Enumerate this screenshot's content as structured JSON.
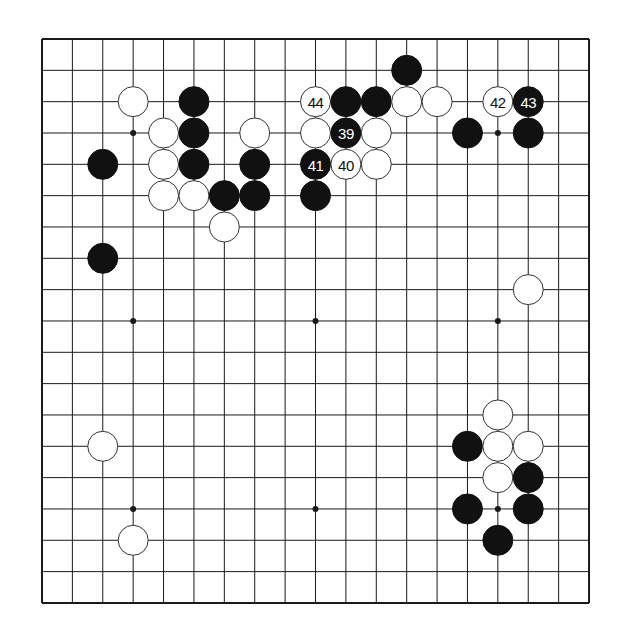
{
  "board": {
    "size": 19,
    "origin": {
      "x": 42,
      "y": 39
    },
    "spacing": {
      "x": 30.39,
      "y": 31.33
    },
    "stone_radius": 15,
    "colors": {
      "line": "#1a1a1a",
      "black": "#111111",
      "white": "#ffffff",
      "background": "#ffffff"
    },
    "star_points": [
      [
        3,
        3
      ],
      [
        9,
        3
      ],
      [
        15,
        3
      ],
      [
        3,
        9
      ],
      [
        9,
        9
      ],
      [
        15,
        9
      ],
      [
        3,
        15
      ],
      [
        9,
        15
      ],
      [
        15,
        15
      ]
    ]
  },
  "stones": [
    {
      "col": 12,
      "row": 1,
      "color": "black",
      "label": ""
    },
    {
      "col": 9,
      "row": 2,
      "color": "white",
      "label": "44"
    },
    {
      "col": 10,
      "row": 2,
      "color": "black",
      "label": ""
    },
    {
      "col": 11,
      "row": 2,
      "color": "black",
      "label": ""
    },
    {
      "col": 12,
      "row": 2,
      "color": "white",
      "label": ""
    },
    {
      "col": 13,
      "row": 2,
      "color": "white",
      "label": ""
    },
    {
      "col": 9,
      "row": 3,
      "color": "white",
      "label": ""
    },
    {
      "col": 10,
      "row": 3,
      "color": "black",
      "label": "39"
    },
    {
      "col": 11,
      "row": 3,
      "color": "white",
      "label": ""
    },
    {
      "col": 9,
      "row": 4,
      "color": "black",
      "label": "41"
    },
    {
      "col": 10,
      "row": 4,
      "color": "white",
      "label": "40"
    },
    {
      "col": 11,
      "row": 4,
      "color": "white",
      "label": ""
    },
    {
      "col": 9,
      "row": 5,
      "color": "black",
      "label": ""
    },
    {
      "col": 15,
      "row": 2,
      "color": "white",
      "label": "42"
    },
    {
      "col": 16,
      "row": 2,
      "color": "black",
      "label": "43"
    },
    {
      "col": 14,
      "row": 3,
      "color": "black",
      "label": ""
    },
    {
      "col": 16,
      "row": 3,
      "color": "black",
      "label": ""
    },
    {
      "col": 3,
      "row": 2,
      "color": "white",
      "label": ""
    },
    {
      "col": 5,
      "row": 2,
      "color": "black",
      "label": ""
    },
    {
      "col": 4,
      "row": 3,
      "color": "white",
      "label": ""
    },
    {
      "col": 5,
      "row": 3,
      "color": "black",
      "label": ""
    },
    {
      "col": 7,
      "row": 3,
      "color": "white",
      "label": ""
    },
    {
      "col": 2,
      "row": 4,
      "color": "black",
      "label": ""
    },
    {
      "col": 4,
      "row": 4,
      "color": "white",
      "label": ""
    },
    {
      "col": 5,
      "row": 4,
      "color": "black",
      "label": ""
    },
    {
      "col": 7,
      "row": 4,
      "color": "black",
      "label": ""
    },
    {
      "col": 4,
      "row": 5,
      "color": "white",
      "label": ""
    },
    {
      "col": 5,
      "row": 5,
      "color": "white",
      "label": ""
    },
    {
      "col": 6,
      "row": 5,
      "color": "black",
      "label": ""
    },
    {
      "col": 7,
      "row": 5,
      "color": "black",
      "label": ""
    },
    {
      "col": 6,
      "row": 6,
      "color": "white",
      "label": ""
    },
    {
      "col": 2,
      "row": 7,
      "color": "black",
      "label": ""
    },
    {
      "col": 16,
      "row": 8,
      "color": "white",
      "label": ""
    },
    {
      "col": 15,
      "row": 12,
      "color": "white",
      "label": ""
    },
    {
      "col": 14,
      "row": 13,
      "color": "black",
      "label": ""
    },
    {
      "col": 15,
      "row": 13,
      "color": "white",
      "label": ""
    },
    {
      "col": 16,
      "row": 13,
      "color": "white",
      "label": ""
    },
    {
      "col": 15,
      "row": 14,
      "color": "white",
      "label": ""
    },
    {
      "col": 16,
      "row": 14,
      "color": "black",
      "label": ""
    },
    {
      "col": 14,
      "row": 15,
      "color": "black",
      "label": ""
    },
    {
      "col": 16,
      "row": 15,
      "color": "black",
      "label": ""
    },
    {
      "col": 15,
      "row": 16,
      "color": "black",
      "label": ""
    },
    {
      "col": 2,
      "row": 13,
      "color": "white",
      "label": ""
    },
    {
      "col": 3,
      "row": 16,
      "color": "white",
      "label": ""
    }
  ]
}
